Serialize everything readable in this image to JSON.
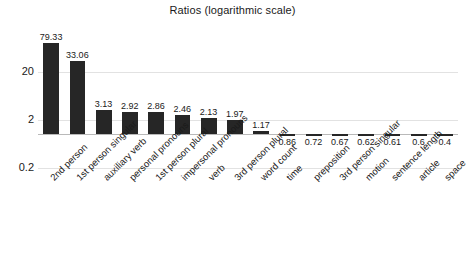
{
  "chart_data": {
    "type": "bar",
    "title": "Ratios (logarithmic scale)",
    "xlabel": "",
    "ylabel": "",
    "scale": "log",
    "grid": true,
    "legend": "none",
    "ylim": [
      0.2,
      100
    ],
    "yticks": [
      "20",
      "2",
      "0.2"
    ],
    "ytick_values": [
      20,
      2,
      0.2
    ],
    "baseline": 1,
    "categories": [
      "2nd person",
      "1st person singular",
      "auxiliary verb",
      "personal pronouns",
      "1st person plural",
      "impersonal pronouns",
      "verb",
      "3rd person plural",
      "word count",
      "time",
      "preposition",
      "3rd person singular",
      "motion",
      "sentence length",
      "article",
      "space"
    ],
    "values": [
      79.33,
      33.06,
      3.13,
      2.92,
      2.86,
      2.46,
      2.13,
      1.97,
      1.17,
      0.86,
      0.72,
      0.67,
      0.62,
      0.61,
      0.6,
      0.4
    ],
    "value_labels": [
      "79.33",
      "33.06",
      "3.13",
      "2.92",
      "2.86",
      "2.46",
      "2.13",
      "1.97",
      "1.17",
      "0.86",
      "0.72",
      "0.67",
      "0.62",
      "0.61",
      "0.6",
      "0.4"
    ],
    "bar_color": "#262626",
    "grid_color": "#e2e2e2",
    "baseline_color": "#b9b9b9",
    "text_color": "#1a1a1a",
    "background": "#ffffff"
  }
}
